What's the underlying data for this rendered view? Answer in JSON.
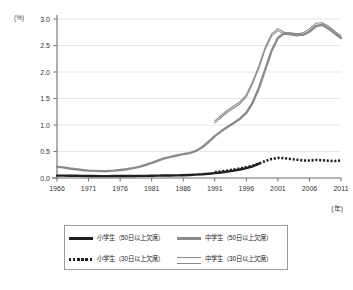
{
  "chart_data": {
    "type": "line",
    "title": "",
    "xlabel": "(年)",
    "ylabel": "(%)",
    "xlim": [
      1966,
      2011
    ],
    "ylim": [
      0.0,
      3.0
    ],
    "grid": true,
    "legend_position": "bottom",
    "y_ticks": [
      "0.0",
      "0.5",
      "1.0",
      "1.5",
      "2.0",
      "2.5",
      "3.0"
    ],
    "y_tick_values": [
      0.0,
      0.5,
      1.0,
      1.5,
      2.0,
      2.5,
      3.0
    ],
    "x_ticks": [
      "1966",
      "1971",
      "1976",
      "1981",
      "1986",
      "1991",
      "1996",
      "2001",
      "2006",
      "2011"
    ],
    "x_tick_values": [
      1966,
      1971,
      1976,
      1981,
      1986,
      1991,
      1996,
      2001,
      2006,
      2011
    ],
    "series": [
      {
        "name": "小学生（50日以上欠席）",
        "style": "solid",
        "color": "#211f1e",
        "width": 2.4,
        "x": [
          1966,
          1967,
          1968,
          1969,
          1970,
          1971,
          1972,
          1973,
          1974,
          1975,
          1976,
          1977,
          1978,
          1979,
          1980,
          1981,
          1982,
          1983,
          1984,
          1985,
          1986,
          1987,
          1988,
          1989,
          1990,
          1991,
          1992,
          1993,
          1994,
          1995,
          1996,
          1997,
          1998
        ],
        "values": [
          0.045,
          0.045,
          0.043,
          0.042,
          0.04,
          0.038,
          0.037,
          0.036,
          0.036,
          0.037,
          0.038,
          0.038,
          0.039,
          0.04,
          0.041,
          0.042,
          0.044,
          0.046,
          0.048,
          0.05,
          0.053,
          0.058,
          0.063,
          0.07,
          0.08,
          0.092,
          0.105,
          0.12,
          0.14,
          0.16,
          0.185,
          0.22,
          0.27
        ]
      },
      {
        "name": "中学生（50日以上欠席）",
        "style": "solid",
        "color": "#8b8b88",
        "width": 2.4,
        "x": [
          1966,
          1967,
          1968,
          1969,
          1970,
          1971,
          1972,
          1973,
          1974,
          1975,
          1976,
          1977,
          1978,
          1979,
          1980,
          1981,
          1982,
          1983,
          1984,
          1985,
          1986,
          1987,
          1988,
          1989,
          1990,
          1991,
          1992,
          1993,
          1994,
          1995,
          1996,
          1997,
          1998,
          1999,
          2000,
          2001,
          2002,
          2003,
          2004,
          2005,
          2006,
          2007,
          2008,
          2009,
          2010,
          2011
        ],
        "values": [
          0.21,
          0.2,
          0.18,
          0.165,
          0.15,
          0.14,
          0.135,
          0.13,
          0.133,
          0.14,
          0.15,
          0.165,
          0.185,
          0.21,
          0.245,
          0.285,
          0.33,
          0.37,
          0.4,
          0.425,
          0.45,
          0.47,
          0.51,
          0.58,
          0.68,
          0.79,
          0.88,
          0.96,
          1.04,
          1.12,
          1.23,
          1.42,
          1.7,
          2.05,
          2.4,
          2.64,
          2.73,
          2.72,
          2.7,
          2.7,
          2.76,
          2.86,
          2.89,
          2.82,
          2.73,
          2.64
        ]
      },
      {
        "name": "小学生（30日以上欠席）",
        "style": "dotted",
        "color": "#211f1e",
        "width": 2.6,
        "x": [
          1991,
          1992,
          1993,
          1994,
          1995,
          1996,
          1997,
          1998,
          1999,
          2000,
          2001,
          2002,
          2003,
          2004,
          2005,
          2006,
          2007,
          2008,
          2009,
          2010,
          2011
        ],
        "values": [
          0.11,
          0.125,
          0.14,
          0.16,
          0.18,
          0.2,
          0.23,
          0.27,
          0.32,
          0.36,
          0.38,
          0.375,
          0.36,
          0.345,
          0.33,
          0.33,
          0.34,
          0.335,
          0.325,
          0.32,
          0.33
        ]
      },
      {
        "name": "中学生（30日以上欠席）",
        "style": "thin-double",
        "color": "#8b8b88",
        "width": 1.1,
        "x": [
          1991,
          1992,
          1993,
          1994,
          1995,
          1996,
          1997,
          1998,
          1999,
          2000,
          2001,
          2002,
          2003,
          2004,
          2005,
          2006,
          2007,
          2008,
          2009,
          2010,
          2011
        ],
        "values": [
          1.06,
          1.16,
          1.26,
          1.34,
          1.42,
          1.55,
          1.8,
          2.1,
          2.45,
          2.7,
          2.8,
          2.73,
          2.72,
          2.7,
          2.72,
          2.8,
          2.9,
          2.91,
          2.85,
          2.75,
          2.66
        ]
      }
    ]
  },
  "legend": {
    "items": [
      {
        "label": "小学生（50日以上欠席）",
        "swatch": "solid-dark"
      },
      {
        "label": "中学生（50日以上欠席）",
        "swatch": "solid-gray"
      },
      {
        "label": "小学生（30日以上欠席）",
        "swatch": "dotted-dark"
      },
      {
        "label": "中学生（30日以上欠席）",
        "swatch": "double-gray"
      }
    ]
  },
  "axis": {
    "y_unit": "(%)",
    "x_unit": "(年)"
  },
  "colors": {
    "dark_line": "#211f1e",
    "gray_line": "#8b8b88",
    "grid": "#dcdcdc",
    "axis": "#6e6e6e",
    "legend_border": "#9a9a9a"
  }
}
